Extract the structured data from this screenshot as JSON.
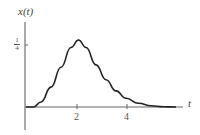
{
  "chart_data": {
    "type": "line",
    "title": "",
    "xlabel": "t",
    "ylabel": "x(t)",
    "x_ticks": [
      "2",
      "4"
    ],
    "y_ticks": [
      "1/4"
    ],
    "y_tick_num": "1",
    "y_tick_den": "4",
    "xlim": [
      0,
      6.2
    ],
    "ylim": [
      -0.1,
      0.36
    ],
    "grid": false,
    "series": [
      {
        "name": "x(t)",
        "x": [
          0,
          0.3,
          0.6,
          1.0,
          1.4,
          1.8,
          2.1,
          2.4,
          2.8,
          3.2,
          3.6,
          4.0,
          4.5,
          5.0,
          5.5,
          6.0
        ],
        "y": [
          0,
          0,
          0.02,
          0.08,
          0.16,
          0.24,
          0.27,
          0.24,
          0.17,
          0.11,
          0.065,
          0.035,
          0.015,
          0.005,
          0.001,
          0
        ]
      }
    ],
    "line_color": "#222222"
  }
}
